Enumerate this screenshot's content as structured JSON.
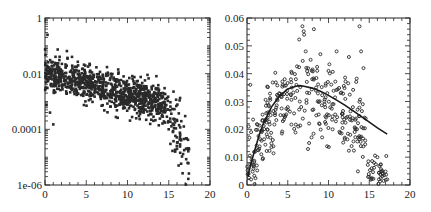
{
  "chart_data": [
    {
      "type": "scatter",
      "title": "",
      "xlabel": "",
      "ylabel": "",
      "xlim": [
        0,
        20
      ],
      "ylim": [
        1e-06,
        1
      ],
      "yscale": "log",
      "x_ticks": [
        "0",
        "5",
        "10",
        "15",
        "20"
      ],
      "y_ticks": [
        "1e-06",
        "0.0001",
        "0.01",
        "1"
      ],
      "grid": false,
      "legend": null,
      "marker": "filled-square-small",
      "series": [
        {
          "name": "scatter",
          "trend_description": "Dense cloud starting ~0.01 near x=0-2, decreasing log-linearly to ~0.001 at x=14, then sharp drop to 1e-5..1e-4 for x=14.5-17.5",
          "points": [
            [
              0.3,
              0.25
            ],
            [
              0.2,
              0.01
            ],
            [
              0.5,
              0.012
            ],
            [
              0.8,
              0.008
            ],
            [
              1.0,
              0.015
            ],
            [
              1.2,
              0.006
            ],
            [
              1.5,
              0.02
            ],
            [
              2.0,
              0.01
            ],
            [
              2.5,
              0.008
            ],
            [
              3.0,
              0.006
            ],
            [
              4.0,
              0.004
            ],
            [
              5.0,
              0.003
            ],
            [
              6.0,
              0.002
            ],
            [
              7.0,
              0.0018
            ],
            [
              8.0,
              0.0015
            ],
            [
              9.0,
              0.0012
            ],
            [
              10.0,
              0.001
            ],
            [
              11.0,
              0.0009
            ],
            [
              12.0,
              0.0008
            ],
            [
              13.0,
              0.0008
            ],
            [
              14.0,
              0.0006
            ],
            [
              14.5,
              0.003
            ],
            [
              15.0,
              0.0001
            ],
            [
              15.2,
              3e-05
            ],
            [
              15.5,
              8e-05
            ],
            [
              16.0,
              2e-05
            ],
            [
              16.2,
              5e-06
            ],
            [
              16.5,
              4e-05
            ],
            [
              17.0,
              0.0003
            ],
            [
              17.2,
              2e-05
            ],
            [
              1.0,
              0.00015
            ],
            [
              0.6,
              0.0004
            ]
          ]
        }
      ]
    },
    {
      "type": "scatter",
      "title": "",
      "xlabel": "",
      "ylabel": "",
      "xlim": [
        0,
        20
      ],
      "ylim": [
        0,
        0.06
      ],
      "x_ticks": [
        "0",
        "5",
        "10",
        "15",
        "20"
      ],
      "y_ticks": [
        "0",
        "0.01",
        "0.02",
        "0.03",
        "0.04",
        "0.05",
        "0.06"
      ],
      "grid": false,
      "legend": null,
      "marker": "open-circle-small",
      "series": [
        {
          "name": "scatter",
          "points": [
            [
              0.2,
              0.021
            ],
            [
              0.3,
              0.017
            ],
            [
              0.5,
              0.019
            ],
            [
              0.4,
              0.036
            ],
            [
              1.0,
              0.012
            ],
            [
              1.2,
              0.007
            ],
            [
              1.5,
              0.013
            ],
            [
              1.8,
              0.019
            ],
            [
              2.2,
              0.023
            ],
            [
              2.5,
              0.02
            ],
            [
              3.0,
              0.015
            ],
            [
              3.5,
              0.027
            ],
            [
              3.8,
              0.032
            ],
            [
              4.5,
              0.025
            ],
            [
              5.0,
              0.028
            ],
            [
              5.5,
              0.035
            ],
            [
              6.0,
              0.038
            ],
            [
              6.3,
              0.021
            ],
            [
              6.8,
              0.057
            ],
            [
              7.0,
              0.054
            ],
            [
              7.2,
              0.048
            ],
            [
              7.8,
              0.045
            ],
            [
              8.0,
              0.038
            ],
            [
              8.5,
              0.025
            ],
            [
              9.0,
              0.047
            ],
            [
              9.5,
              0.03
            ],
            [
              10.0,
              0.041
            ],
            [
              10.5,
              0.02
            ],
            [
              11.0,
              0.048
            ],
            [
              11.5,
              0.033
            ],
            [
              12.0,
              0.017
            ],
            [
              12.5,
              0.046
            ],
            [
              13.0,
              0.028
            ],
            [
              13.5,
              0.02
            ],
            [
              13.8,
              0.057
            ],
            [
              14.0,
              0.048
            ],
            [
              14.3,
              0.042
            ],
            [
              14.5,
              0.016
            ],
            [
              15.0,
              0.003
            ],
            [
              15.3,
              0.006
            ],
            [
              15.6,
              0.008
            ],
            [
              16.0,
              0.01
            ],
            [
              16.2,
              0.002
            ],
            [
              16.5,
              0.005
            ],
            [
              17.2,
              0.002
            ]
          ]
        },
        {
          "name": "fit-curve",
          "type": "line",
          "x": [
            0.1,
            0.5,
            1,
            1.5,
            2,
            3,
            4,
            5,
            6,
            6.5,
            7,
            8,
            9,
            10,
            11,
            12,
            13,
            14,
            15,
            16,
            17.2
          ],
          "values": [
            0.003,
            0.008,
            0.013,
            0.018,
            0.022,
            0.028,
            0.032,
            0.0345,
            0.0355,
            0.0357,
            0.0355,
            0.0348,
            0.0337,
            0.0322,
            0.0305,
            0.0287,
            0.0267,
            0.0247,
            0.0226,
            0.0205,
            0.0183
          ]
        }
      ]
    }
  ],
  "panels": [
    {
      "id": "left",
      "box": {
        "x0": 45,
        "y0": 18,
        "x1": 210,
        "y1": 185
      },
      "x_tick_labels": [
        "0",
        "5",
        "10",
        "15",
        "20"
      ],
      "y_tick_labels": [
        "1e-06",
        "0.0001",
        "0.01",
        "1"
      ]
    },
    {
      "id": "right",
      "box": {
        "x0": 247,
        "y0": 18,
        "x1": 410,
        "y1": 185
      },
      "x_tick_labels": [
        "0",
        "5",
        "10",
        "15",
        "20"
      ],
      "y_tick_labels": [
        "0",
        "0.01",
        "0.02",
        "0.03",
        "0.04",
        "0.05",
        "0.06"
      ]
    }
  ],
  "colors": {
    "axis": "#222222",
    "marker": "#2a2a2a",
    "curve": "#1a1a1a",
    "background": "#ffffff"
  }
}
